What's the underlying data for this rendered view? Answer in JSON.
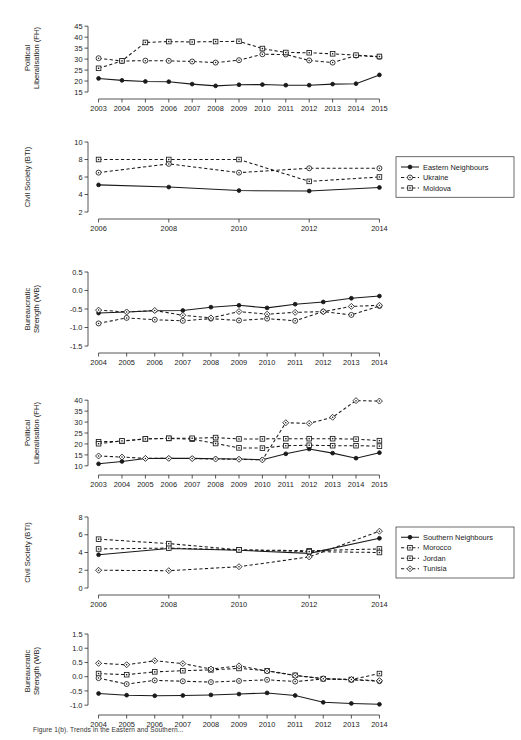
{
  "figure": {
    "caption": "Figure 1(b). Trends in the Eastern and Southern...",
    "background": "#ffffff",
    "ink": "#1a1a1a"
  },
  "legends": [
    {
      "name": "eastern-legend",
      "items": [
        {
          "label": "Eastern Neighbours",
          "style": "solid",
          "marker": "filled-circle"
        },
        {
          "label": "Ukraine",
          "style": "dashed",
          "marker": "open-circle"
        },
        {
          "label": "Moldova",
          "style": "dashed",
          "marker": "open-square"
        }
      ]
    },
    {
      "name": "southern-legend",
      "items": [
        {
          "label": "Southern Neighbours",
          "style": "solid",
          "marker": "filled-circle"
        },
        {
          "label": "Morocco",
          "style": "dashed",
          "marker": "open-square"
        },
        {
          "label": "Jordan",
          "style": "dashed",
          "marker": "open-square"
        },
        {
          "label": "Tunisia",
          "style": "dashed",
          "marker": "open-diamond"
        }
      ]
    }
  ],
  "chart_data": [
    {
      "id": "east-political",
      "type": "line",
      "title": "",
      "ylabel": "Political Liberalisation (FH)",
      "xlabel": "",
      "x": [
        2003,
        2004,
        2005,
        2006,
        2007,
        2008,
        2009,
        2010,
        2011,
        2012,
        2013,
        2014,
        2015
      ],
      "xticklabels": [
        "2003",
        "2004",
        "2005",
        "2006",
        "2007",
        "2008",
        "2009",
        "2010",
        "2011",
        "2012",
        "2013",
        "2014",
        "2015"
      ],
      "yticks": [
        15,
        20,
        25,
        30,
        35,
        40,
        45
      ],
      "ylim": [
        15,
        46
      ],
      "grid": false,
      "series": [
        {
          "name": "Eastern Neighbours",
          "marker": "filled-circle",
          "style": "solid",
          "values": [
            21.2,
            20.3,
            19.8,
            19.7,
            18.6,
            17.8,
            18.3,
            18.4,
            18.1,
            18.1,
            18.6,
            18.8,
            22.8
          ]
        },
        {
          "name": "Ukraine",
          "marker": "open-circle",
          "style": "dashed",
          "values": [
            30.4,
            29.1,
            29.3,
            29.2,
            28.9,
            28.4,
            29.5,
            32.2,
            32.1,
            29.4,
            28.4,
            31.6,
            31.0
          ]
        },
        {
          "name": "Moldova",
          "marker": "open-square",
          "style": "dashed",
          "values": [
            25.8,
            29.2,
            37.6,
            38.0,
            37.8,
            38.0,
            38.1,
            34.8,
            33.0,
            32.9,
            32.4,
            31.8,
            31.2
          ]
        }
      ]
    },
    {
      "id": "east-civil",
      "type": "line",
      "title": "",
      "ylabel": "Civil Society (BTI)",
      "xlabel": "",
      "x": [
        2006,
        2008,
        2010,
        2012,
        2014
      ],
      "xticklabels": [
        "2006",
        "2008",
        "2010",
        "2012",
        "2014"
      ],
      "yticks": [
        2,
        4,
        6,
        8,
        10
      ],
      "ylim": [
        2,
        10
      ],
      "grid": false,
      "series": [
        {
          "name": "Eastern Neighbours",
          "marker": "filled-circle",
          "style": "solid",
          "values": [
            5.1,
            4.85,
            4.45,
            4.4,
            4.8
          ]
        },
        {
          "name": "Ukraine",
          "marker": "open-circle",
          "style": "dashed",
          "values": [
            6.5,
            7.5,
            6.5,
            7.0,
            7.0
          ]
        },
        {
          "name": "Moldova",
          "marker": "open-square",
          "style": "dashed",
          "values": [
            8.0,
            8.0,
            8.0,
            5.5,
            6.0
          ]
        }
      ]
    },
    {
      "id": "east-bureaucratic",
      "type": "line",
      "title": "",
      "ylabel": "Bureaucratic Strength (WB)",
      "xlabel": "",
      "x": [
        2004,
        2005,
        2006,
        2007,
        2008,
        2009,
        2010,
        2011,
        2012,
        2013,
        2014
      ],
      "xticklabels": [
        "2004",
        "2005",
        "2006",
        "2007",
        "2008",
        "2009",
        "2010",
        "2011",
        "2012",
        "2013",
        "2014"
      ],
      "yticks": [
        -1.5,
        -1.0,
        -0.5,
        0.0,
        0.5
      ],
      "ylim": [
        -1.5,
        0.5
      ],
      "grid": false,
      "series": [
        {
          "name": "Eastern Neighbours",
          "marker": "filled-circle",
          "style": "solid",
          "values": [
            -0.61,
            -0.58,
            -0.55,
            -0.54,
            -0.45,
            -0.4,
            -0.47,
            -0.37,
            -0.31,
            -0.21,
            -0.15
          ]
        },
        {
          "name": "Ukraine",
          "marker": "open-circle",
          "style": "dashed",
          "values": [
            -0.89,
            -0.74,
            -0.79,
            -0.82,
            -0.76,
            -0.81,
            -0.76,
            -0.82,
            -0.57,
            -0.66,
            -0.42
          ]
        },
        {
          "name": "Moldova",
          "marker": "open-diamond",
          "style": "dashed",
          "values": [
            -0.53,
            -0.58,
            -0.54,
            -0.67,
            -0.74,
            -0.57,
            -0.64,
            -0.59,
            -0.57,
            -0.43,
            -0.4
          ]
        }
      ]
    },
    {
      "id": "south-political",
      "type": "line",
      "title": "",
      "ylabel": "Political Liberalisation (FH)",
      "xlabel": "",
      "x": [
        2003,
        2004,
        2005,
        2006,
        2007,
        2008,
        2009,
        2010,
        2011,
        2012,
        2013,
        2014,
        2015
      ],
      "xticklabels": [
        "2003",
        "2004",
        "2005",
        "2006",
        "2007",
        "2008",
        "2009",
        "2010",
        "2011",
        "2012",
        "2013",
        "2014",
        "2015"
      ],
      "yticks": [
        10,
        15,
        20,
        25,
        30,
        35,
        40
      ],
      "ylim": [
        9,
        41
      ],
      "grid": false,
      "series": [
        {
          "name": "Southern Neighbours",
          "marker": "filled-circle",
          "style": "solid",
          "values": [
            10.9,
            12.0,
            13.3,
            13.4,
            13.4,
            13.2,
            13.1,
            12.8,
            15.5,
            17.7,
            15.8,
            13.5,
            16.0
          ]
        },
        {
          "name": "Morocco",
          "marker": "open-square",
          "style": "dashed",
          "values": [
            21.0,
            21.2,
            22.3,
            22.5,
            22.2,
            20.2,
            18.2,
            18.1,
            19.2,
            19.4,
            19.2,
            19.2,
            19.0
          ]
        },
        {
          "name": "Jordan",
          "marker": "open-square",
          "style": "dashed",
          "values": [
            20.1,
            21.4,
            22.3,
            22.6,
            22.6,
            22.9,
            22.3,
            22.3,
            22.4,
            22.4,
            22.4,
            22.2,
            21.5
          ]
        },
        {
          "name": "Tunisia",
          "marker": "open-diamond",
          "style": "dashed",
          "values": [
            14.5,
            14.0,
            13.4,
            13.4,
            13.3,
            13.1,
            13.0,
            12.7,
            29.7,
            29.4,
            32.2,
            39.8,
            39.6
          ]
        }
      ]
    },
    {
      "id": "south-civil",
      "type": "line",
      "title": "",
      "ylabel": "Civil Society (BTI)",
      "xlabel": "",
      "x": [
        2006,
        2008,
        2010,
        2012,
        2014
      ],
      "xticklabels": [
        "2006",
        "2008",
        "2010",
        "2012",
        "2014"
      ],
      "yticks": [
        0,
        2,
        4,
        6,
        8
      ],
      "ylim": [
        0,
        8
      ],
      "grid": false,
      "series": [
        {
          "name": "Southern Neighbours",
          "marker": "filled-circle",
          "style": "solid",
          "values": [
            3.75,
            4.45,
            4.25,
            3.9,
            5.6
          ]
        },
        {
          "name": "Morocco",
          "marker": "open-square",
          "style": "dashed",
          "values": [
            4.4,
            4.5,
            4.3,
            4.2,
            4.4
          ]
        },
        {
          "name": "Jordan",
          "marker": "open-square",
          "style": "dashed",
          "values": [
            5.5,
            5.0,
            4.3,
            4.1,
            4.0
          ]
        },
        {
          "name": "Tunisia",
          "marker": "open-diamond",
          "style": "dashed",
          "values": [
            2.0,
            1.95,
            2.4,
            3.5,
            6.4
          ]
        }
      ]
    },
    {
      "id": "south-bureaucratic",
      "type": "line",
      "title": "",
      "ylabel": "Bureaucratic Strength (WB)",
      "xlabel": "",
      "x": [
        2004,
        2005,
        2006,
        2007,
        2008,
        2009,
        2010,
        2011,
        2012,
        2013,
        2014
      ],
      "xticklabels": [
        "2004",
        "2005",
        "2006",
        "2007",
        "2008",
        "2009",
        "2010",
        "2011",
        "2012",
        "2013",
        "2014"
      ],
      "yticks": [
        -1.0,
        -0.5,
        0.0,
        0.5,
        1.0,
        1.5
      ],
      "ylim": [
        -1.1,
        1.5
      ],
      "grid": false,
      "series": [
        {
          "name": "Southern Neighbours",
          "marker": "filled-circle",
          "style": "solid",
          "values": [
            -0.59,
            -0.65,
            -0.67,
            -0.66,
            -0.64,
            -0.61,
            -0.57,
            -0.66,
            -0.9,
            -0.94,
            -0.97
          ]
        },
        {
          "name": "Morocco",
          "marker": "open-square",
          "style": "dashed",
          "values": [
            0.11,
            0.07,
            0.17,
            0.21,
            0.24,
            0.29,
            0.21,
            0.05,
            -0.07,
            -0.1,
            0.11
          ]
        },
        {
          "name": "Jordan",
          "marker": "open-circle",
          "style": "dashed",
          "values": [
            -0.05,
            -0.26,
            -0.13,
            -0.16,
            -0.19,
            -0.15,
            -0.11,
            -0.17,
            -0.08,
            -0.11,
            -0.16
          ]
        },
        {
          "name": "Tunisia",
          "marker": "open-diamond",
          "style": "dashed",
          "values": [
            0.47,
            0.42,
            0.56,
            0.46,
            0.27,
            0.38,
            0.2,
            0.04,
            -0.07,
            -0.1,
            -0.14
          ]
        }
      ]
    }
  ]
}
